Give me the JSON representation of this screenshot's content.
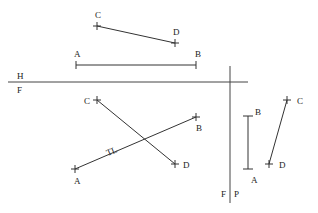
{
  "diagram": {
    "type": "descriptive-geometry-projection",
    "colors": {
      "line": "#333333",
      "background": "#ffffff"
    },
    "fold_lines": {
      "hf": {
        "label_top": "H",
        "label_bottom": "F",
        "x1": 8,
        "y1": 82,
        "x2": 248,
        "y2": 82
      },
      "fp": {
        "label_left": "F",
        "label_right": "P",
        "x1": 230,
        "y1": 66,
        "x2": 230,
        "y2": 203
      }
    },
    "views": {
      "top": {
        "segments": [
          {
            "name": "AB",
            "p1": {
              "label": "A",
              "x": 76,
              "y": 65
            },
            "p2": {
              "label": "B",
              "x": 196,
              "y": 65
            }
          },
          {
            "name": "CD",
            "p1": {
              "label": "C",
              "x": 97,
              "y": 26
            },
            "p2": {
              "label": "D",
              "x": 175,
              "y": 43
            }
          }
        ]
      },
      "front": {
        "segments": [
          {
            "name": "AB",
            "p1": {
              "label": "A",
              "x": 75,
              "y": 169
            },
            "p2": {
              "label": "B",
              "x": 196,
              "y": 117
            },
            "annotation": "TL"
          },
          {
            "name": "CD",
            "p1": {
              "label": "C",
              "x": 97,
              "y": 100
            },
            "p2": {
              "label": "D",
              "x": 175,
              "y": 164
            }
          }
        ]
      },
      "profile": {
        "segments": [
          {
            "name": "AB",
            "p1": {
              "label": "A",
              "x": 248,
              "y": 169
            },
            "p2": {
              "label": "B",
              "x": 248,
              "y": 116
            }
          },
          {
            "name": "CD",
            "p1": {
              "label": "C",
              "x": 287,
              "y": 100
            },
            "p2": {
              "label": "D",
              "x": 269,
              "y": 164
            }
          }
        ]
      }
    },
    "labels": {
      "top_C": "C",
      "top_D": "D",
      "top_A": "A",
      "top_B": "B",
      "fold_H": "H",
      "fold_F": "F",
      "front_C": "C",
      "front_B": "B",
      "front_D": "D",
      "front_A": "A",
      "front_TL": "TL",
      "profile_B": "B",
      "profile_A": "A",
      "profile_C": "C",
      "profile_D": "D",
      "fold_F2": "F",
      "fold_P": "P"
    }
  }
}
